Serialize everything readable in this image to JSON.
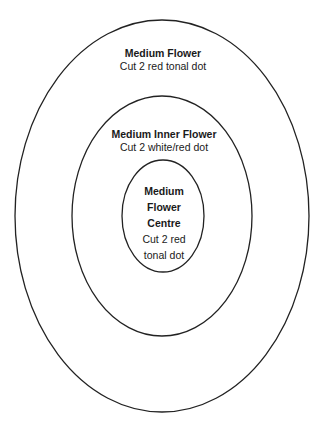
{
  "diagram": {
    "type": "concentric-ellipses",
    "stroke_color": "#222222",
    "background": "#ffffff",
    "rings": [
      {
        "id": "outer",
        "title": "Medium Flower",
        "description": "Cut 2 red tonal dot"
      },
      {
        "id": "middle",
        "title": "Medium Inner Flower",
        "description": "Cut 2 white/red dot"
      },
      {
        "id": "inner",
        "title": "Medium\nFlower\nCentre",
        "description": "Cut 2 red\ntonal dot"
      }
    ]
  }
}
